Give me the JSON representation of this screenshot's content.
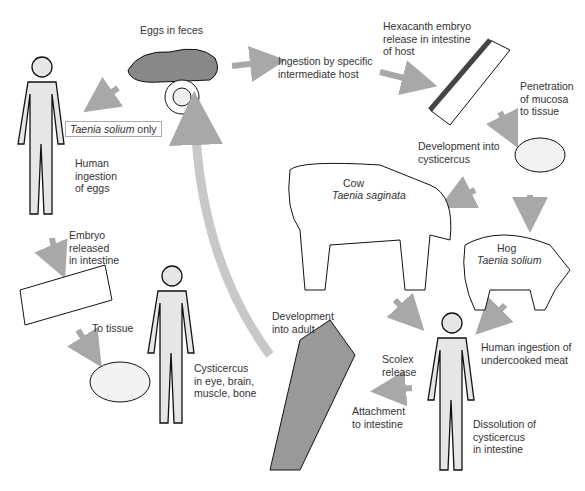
{
  "labels": {
    "eggs_in_feces": "Eggs in feces",
    "ingestion_intermediate": "Ingestion by specific\nintermediate host",
    "hexacanth": "Hexacanth embryo\nrelease in intestine\nof host",
    "penetration": "Penetration\nof mucosa\nto tissue",
    "dev_cysticercus": "Development into\ncysticercus",
    "cow": "Cow",
    "cow_species": "Taenia saginata",
    "hog": "Hog",
    "hog_species": "Taenia solium",
    "human_undercooked": "Human ingestion of\nundercooked meat",
    "dissolution": "Dissolution of\ncysticercus\nin intestine",
    "scolex": "Scolex\nrelease",
    "attachment": "Attachment\nto intestine",
    "dev_adult": "Development\ninto adult",
    "solium_only_species": "Taenia solium",
    "solium_only_suffix": " only",
    "human_eggs": "Human\ningestion\nof eggs",
    "embryo_released": "Embryo\nreleased\nin intestine",
    "to_tissue": "To tissue",
    "cysticercus_sites": "Cysticercus\nin eye, brain,\nmuscle, bone"
  },
  "colors": {
    "arrow": "#a8a8a8",
    "fill_light": "#e6e6e6",
    "fill_dark": "#8c8c8c",
    "outline": "#111111"
  }
}
